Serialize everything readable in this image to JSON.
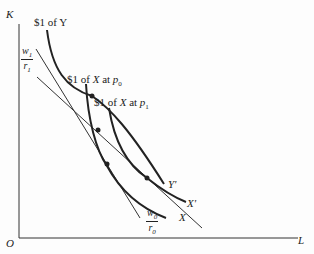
{
  "diagram": {
    "axes": {
      "y_label": "K",
      "x_label": "L",
      "origin_label": "O"
    },
    "curves": [
      {
        "id": "isoquant-y",
        "top_label": "$1 of Y",
        "end_label": "Y'"
      },
      {
        "id": "isoquant-x-p0",
        "top_label_prefix": "$1 of ",
        "top_label_var": "X",
        "top_label_mid": " at ",
        "top_label_price": "p",
        "top_label_sub": "0",
        "end_label": "X"
      },
      {
        "id": "isoquant-x-p1",
        "top_label_prefix": "$1 of ",
        "top_label_var": "X",
        "top_label_mid": " at ",
        "top_label_price": "p",
        "top_label_sub": "1",
        "end_label": "X'"
      }
    ],
    "isocost_lines": [
      {
        "id": "w1-r1",
        "num": "w",
        "num_sub": "1",
        "den": "r",
        "den_sub": "1"
      },
      {
        "id": "w0-r0",
        "num": "w",
        "num_sub": "0",
        "den": "r",
        "den_sub": "0"
      }
    ],
    "colors": {
      "ink": "#222222",
      "background": "#fdfdfd"
    }
  }
}
